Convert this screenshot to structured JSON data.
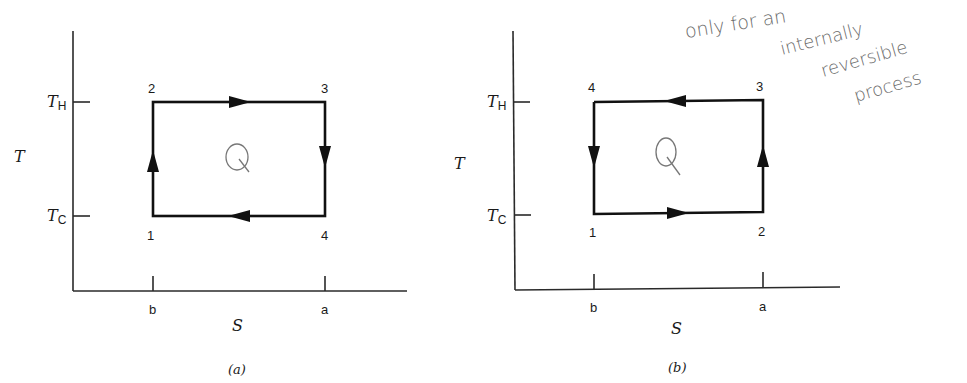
{
  "figure": {
    "panels": [
      {
        "id": "a",
        "caption": "(a)",
        "y_axis_label": "T",
        "x_axis_label": "S",
        "y_ticks": [
          {
            "label": "T",
            "subscript": "H"
          },
          {
            "label": "T",
            "subscript": "C"
          }
        ],
        "x_ticks": [
          "b",
          "a"
        ],
        "states": {
          "bottom_left": "1",
          "top_left": "2",
          "top_right": "3",
          "bottom_right": "4"
        },
        "direction": "clockwise (1→2→3→4→1)",
        "area_label": "Q"
      },
      {
        "id": "b",
        "caption": "(b)",
        "y_axis_label": "T",
        "x_axis_label": "S",
        "y_ticks": [
          {
            "label": "T",
            "subscript": "H"
          },
          {
            "label": "T",
            "subscript": "C"
          }
        ],
        "x_ticks": [
          "b",
          "a"
        ],
        "states": {
          "bottom_left": "1",
          "bottom_right": "2",
          "top_right": "3",
          "top_left": "4"
        },
        "direction": "counterclockwise (1→2→3→4→1)",
        "area_label": "Q"
      }
    ],
    "annotation": {
      "lines": [
        "only  for an",
        "internally",
        "reversible",
        "process"
      ]
    }
  }
}
